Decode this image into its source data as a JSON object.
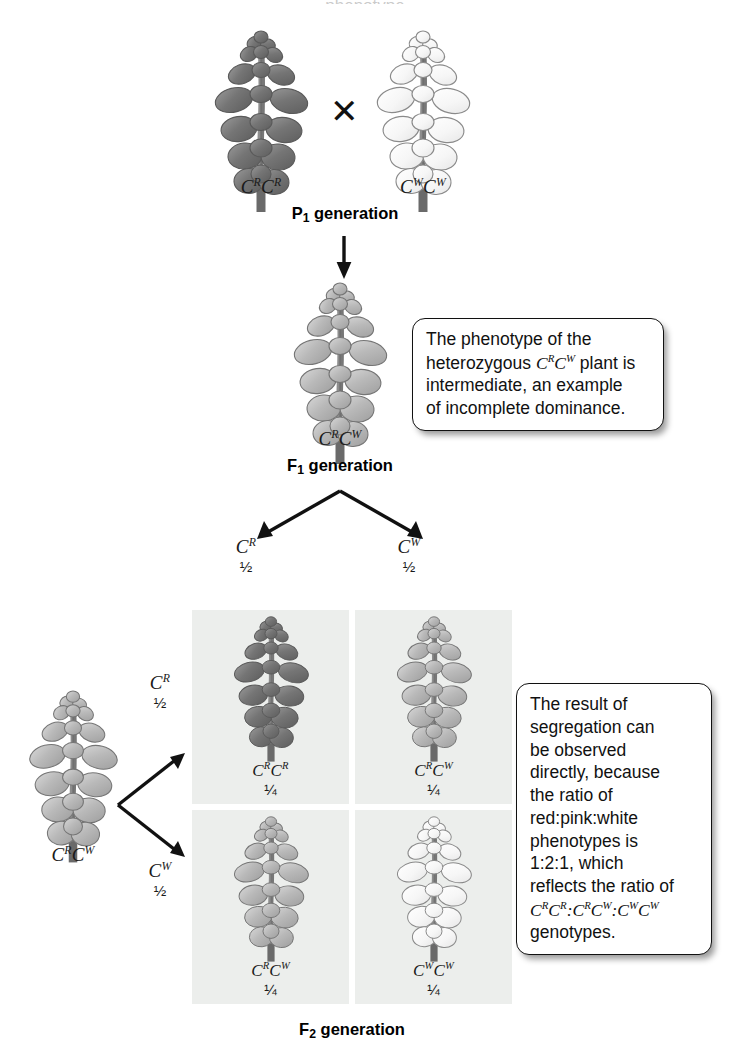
{
  "figure": {
    "title_cropped": "phenotype",
    "generations": {
      "p1": "P₁ generation",
      "f1": "F₁ generation",
      "f2": "F₂ generation"
    }
  },
  "p1_cross": {
    "parent_left": {
      "genotype_base1": "C",
      "genotype_sup1": "R",
      "genotype_base2": "C",
      "genotype_sup2": "R",
      "phenotype": "red"
    },
    "cross_symbol": "✕",
    "parent_right": {
      "genotype_base1": "C",
      "genotype_sup1": "W",
      "genotype_base2": "C",
      "genotype_sup2": "W",
      "phenotype": "white"
    }
  },
  "f1": {
    "genotype_base1": "C",
    "genotype_sup1": "R",
    "genotype_base2": "C",
    "genotype_sup2": "W",
    "phenotype": "pink"
  },
  "callout_1": {
    "line1": "The phenotype of the",
    "line2_a": "heterozygous ",
    "line2_geno_b1": "C",
    "line2_geno_s1": "R",
    "line2_geno_b2": "C",
    "line2_geno_s2": "W",
    "line2_c": " plant is",
    "line3": "intermediate, an example",
    "line4": "of incomplete dominance."
  },
  "callout_2": {
    "line1": "The result of",
    "line2": "segregation can",
    "line3": "be observed",
    "line4": "directly, because",
    "line5": "the ratio of",
    "line6": "red:pink:white",
    "line7": "phenotypes is",
    "line8": "1:2:1, which",
    "line9": "reflects the ratio of",
    "line10_g1b1": "C",
    "line10_g1s1": "R",
    "line10_g1b2": "C",
    "line10_g1s2": "R",
    "line10_sep1": ":",
    "line10_g2b1": "C",
    "line10_g2s1": "R",
    "line10_g2b2": "C",
    "line10_g2s2": "W",
    "line10_sep2": ":",
    "line10_g3b1": "C",
    "line10_g3s1": "W",
    "line10_g3b2": "C",
    "line10_g3s2": "W",
    "line11": "genotypes."
  },
  "gametes": {
    "f1_top_left": {
      "base": "C",
      "sup": "R",
      "fraction": "½"
    },
    "f1_top_right": {
      "base": "C",
      "sup": "W",
      "fraction": "½"
    },
    "f1_side_top": {
      "base": "C",
      "sup": "R",
      "fraction": "½"
    },
    "f1_side_bottom": {
      "base": "C",
      "sup": "W",
      "fraction": "½"
    }
  },
  "side_parent": {
    "genotype_base1": "C",
    "genotype_sup1": "R",
    "genotype_base2": "C",
    "genotype_sup2": "W",
    "phenotype": "pink"
  },
  "punnett_cells": [
    {
      "id": "cell-rr",
      "base1": "C",
      "sup1": "R",
      "base2": "C",
      "sup2": "R",
      "fraction": "¼",
      "phenotype": "red"
    },
    {
      "id": "cell-rw",
      "base1": "C",
      "sup1": "R",
      "base2": "C",
      "sup2": "W",
      "fraction": "¼",
      "phenotype": "pink"
    },
    {
      "id": "cell-wr",
      "base1": "C",
      "sup1": "R",
      "base2": "C",
      "sup2": "W",
      "fraction": "¼",
      "phenotype": "pink"
    },
    {
      "id": "cell-ww",
      "base1": "C",
      "sup1": "W",
      "base2": "C",
      "sup2": "W",
      "fraction": "¼",
      "phenotype": "white"
    }
  ],
  "colors": {
    "punnett_cell_bg": "#eceeec",
    "callout_border": "#111111",
    "text": "#111111",
    "red_flower_dark": "#6e6e6e",
    "pink_flower_mid": "#a9a9a9",
    "white_flower_light": "#f2f2f2"
  }
}
